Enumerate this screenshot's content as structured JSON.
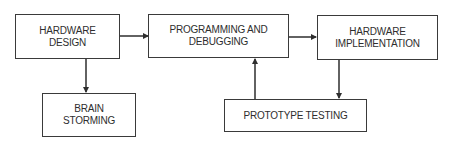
{
  "diagram": {
    "type": "flowchart",
    "nodes": [
      {
        "id": "hardware_design",
        "label": "HARDWARE\nDESIGN"
      },
      {
        "id": "programming_debugging",
        "label": "PROGRAMMING AND\nDEBUGGING"
      },
      {
        "id": "hardware_implementation",
        "label": "HARDWARE\nIMPLEMENTATION"
      },
      {
        "id": "brain_storming",
        "label": "BRAIN\nSTORMING"
      },
      {
        "id": "prototype_testing",
        "label": "PROTOTYPE TESTING"
      }
    ],
    "edges": [
      {
        "from": "hardware_design",
        "to": "programming_debugging"
      },
      {
        "from": "programming_debugging",
        "to": "hardware_implementation"
      },
      {
        "from": "hardware_design",
        "to": "brain_storming"
      },
      {
        "from": "hardware_implementation",
        "to": "prototype_testing"
      },
      {
        "from": "prototype_testing",
        "to": "programming_debugging"
      }
    ],
    "colors": {
      "stroke": "#3a3a3a",
      "text": "#2e2e2e",
      "background": "#ffffff"
    }
  }
}
